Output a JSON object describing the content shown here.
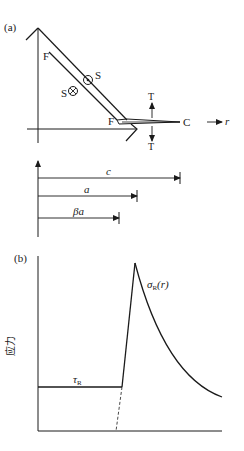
{
  "panel_a": {
    "label": "(a)",
    "labels": {
      "F_top": "F",
      "F_bottom": "F",
      "S_right": "S",
      "S_left": "S",
      "C": "C",
      "T_top": "T",
      "T_bottom": "T",
      "r": "r"
    },
    "icons": {
      "out_of_page": "circle-dot-icon",
      "into_page": "circle-cross-icon"
    },
    "dimensions": [
      {
        "label": "c",
        "style": "italic"
      },
      {
        "label": "a",
        "style": "italic"
      },
      {
        "label": "βa",
        "style": "italic"
      }
    ]
  },
  "panel_b": {
    "label": "(b)",
    "ylabel": "应力",
    "curves": {
      "flat_label_main": "τ",
      "flat_label_sub": "R",
      "peak_label_main": "σ",
      "peak_label_sub": "R",
      "peak_label_arg": "(r)"
    }
  },
  "colors": {
    "ink": "#1a1a1a",
    "background": "#ffffff"
  }
}
